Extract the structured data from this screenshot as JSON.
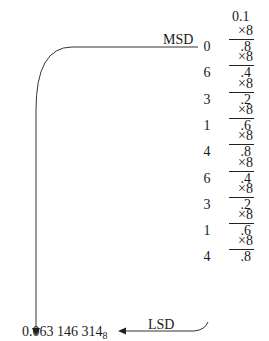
{
  "diagram": {
    "start_value": "0.1",
    "multiplier_label": "×8",
    "msd_label": "MSD",
    "lsd_label": "LSD",
    "steps": [
      {
        "result": ".8",
        "digit": "0"
      },
      {
        "result": ".4",
        "digit": "6"
      },
      {
        "result": ".2",
        "digit": "3"
      },
      {
        "result": ".6",
        "digit": "1"
      },
      {
        "result": ".8",
        "digit": "4"
      },
      {
        "result": ".4",
        "digit": "6"
      },
      {
        "result": ".2",
        "digit": "3"
      },
      {
        "result": ".6",
        "digit": "1"
      },
      {
        "result": ".8",
        "digit": "4"
      }
    ],
    "final_result": {
      "value": "0.063 146 314",
      "base": "8"
    }
  }
}
